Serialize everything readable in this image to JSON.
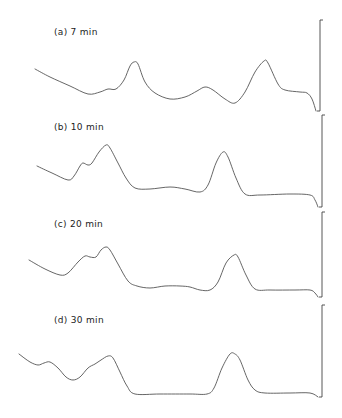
{
  "chart_data": {
    "type": "line",
    "title": "",
    "xlabel": "",
    "ylabel": "",
    "grid": false,
    "legend": "none",
    "panels": [
      {
        "label": "(a)  7 min",
        "time_min": 7,
        "points": [
          [
            35,
            69
          ],
          [
            50,
            77
          ],
          [
            70,
            86
          ],
          [
            88,
            94
          ],
          [
            100,
            92
          ],
          [
            108,
            89
          ],
          [
            116,
            89
          ],
          [
            124,
            80
          ],
          [
            130,
            66
          ],
          [
            134,
            62
          ],
          [
            138,
            64
          ],
          [
            145,
            82
          ],
          [
            155,
            93
          ],
          [
            170,
            99
          ],
          [
            185,
            97
          ],
          [
            197,
            91
          ],
          [
            205,
            87
          ],
          [
            213,
            90
          ],
          [
            225,
            99
          ],
          [
            235,
            103
          ],
          [
            245,
            92
          ],
          [
            255,
            72
          ],
          [
            264,
            61
          ],
          [
            268,
            63
          ],
          [
            278,
            84
          ],
          [
            285,
            90
          ],
          [
            300,
            92
          ],
          [
            307,
            93
          ],
          [
            312,
            99
          ],
          [
            316,
            111
          ]
        ],
        "peaks_x": [
          134,
          205,
          264
        ],
        "bracket": {
          "x": 320,
          "y_top": 20,
          "y_bottom": 111
        }
      },
      {
        "label": "(b) 10 min",
        "time_min": 10,
        "points": [
          [
            37,
            166
          ],
          [
            52,
            173
          ],
          [
            68,
            180
          ],
          [
            74,
            176
          ],
          [
            80,
            166
          ],
          [
            83,
            163
          ],
          [
            88,
            165
          ],
          [
            92,
            163
          ],
          [
            99,
            152
          ],
          [
            106,
            145
          ],
          [
            110,
            148
          ],
          [
            118,
            163
          ],
          [
            126,
            178
          ],
          [
            135,
            188
          ],
          [
            150,
            189
          ],
          [
            170,
            187
          ],
          [
            185,
            189
          ],
          [
            200,
            192
          ],
          [
            208,
            185
          ],
          [
            216,
            163
          ],
          [
            223,
            152
          ],
          [
            228,
            157
          ],
          [
            236,
            178
          ],
          [
            245,
            194
          ],
          [
            260,
            195
          ],
          [
            290,
            194
          ],
          [
            310,
            195
          ],
          [
            315,
            200
          ],
          [
            318,
            207
          ]
        ],
        "peaks_x": [
          106,
          223
        ],
        "bracket": {
          "x": 322,
          "y_top": 115,
          "y_bottom": 207
        }
      },
      {
        "label": "(c)  20 min",
        "time_min": 20,
        "points": [
          [
            29,
            260
          ],
          [
            45,
            269
          ],
          [
            60,
            275
          ],
          [
            68,
            273
          ],
          [
            78,
            262
          ],
          [
            85,
            256
          ],
          [
            90,
            257
          ],
          [
            96,
            257
          ],
          [
            101,
            250
          ],
          [
            106,
            247
          ],
          [
            110,
            250
          ],
          [
            118,
            264
          ],
          [
            128,
            281
          ],
          [
            137,
            286
          ],
          [
            150,
            288
          ],
          [
            165,
            286
          ],
          [
            180,
            286
          ],
          [
            190,
            287
          ],
          [
            200,
            290
          ],
          [
            210,
            290
          ],
          [
            218,
            282
          ],
          [
            226,
            263
          ],
          [
            234,
            255
          ],
          [
            238,
            257
          ],
          [
            246,
            275
          ],
          [
            255,
            289
          ],
          [
            270,
            290
          ],
          [
            295,
            290
          ],
          [
            310,
            290
          ],
          [
            315,
            293
          ],
          [
            318,
            297
          ]
        ],
        "peaks_x": [
          106,
          234
        ],
        "bracket": {
          "x": 322,
          "y_top": 212,
          "y_bottom": 297
        }
      },
      {
        "label": "(d)  30 min",
        "time_min": 30,
        "points": [
          [
            19,
            354
          ],
          [
            30,
            362
          ],
          [
            38,
            365
          ],
          [
            44,
            363
          ],
          [
            50,
            362
          ],
          [
            58,
            368
          ],
          [
            66,
            377
          ],
          [
            73,
            380
          ],
          [
            80,
            377
          ],
          [
            88,
            368
          ],
          [
            95,
            364
          ],
          [
            101,
            360
          ],
          [
            108,
            356
          ],
          [
            113,
            358
          ],
          [
            120,
            372
          ],
          [
            127,
            386
          ],
          [
            135,
            394
          ],
          [
            160,
            394
          ],
          [
            190,
            394
          ],
          [
            207,
            394
          ],
          [
            214,
            388
          ],
          [
            222,
            368
          ],
          [
            230,
            354
          ],
          [
            235,
            354
          ],
          [
            240,
            360
          ],
          [
            248,
            380
          ],
          [
            255,
            390
          ],
          [
            265,
            393
          ],
          [
            290,
            393
          ],
          [
            310,
            393
          ],
          [
            318,
            397
          ]
        ],
        "peaks_x": [
          48,
          108,
          233
        ],
        "bracket": {
          "x": 322,
          "y_top": 305,
          "y_bottom": 397
        }
      }
    ]
  },
  "labels": {
    "a": "(a)  7 min",
    "b": "(b) 10 min",
    "c": "(c)  20 min",
    "d": "(d)  30 min"
  }
}
